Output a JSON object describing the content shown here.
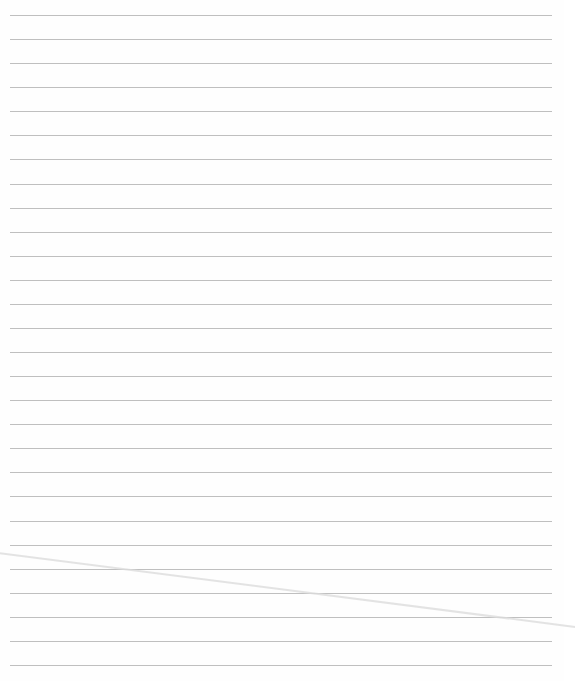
{
  "document": {
    "type": "lined-paper",
    "rule_count": 28,
    "rule_color": "#a9a9a9",
    "background_color": "#fefefe",
    "text": []
  }
}
